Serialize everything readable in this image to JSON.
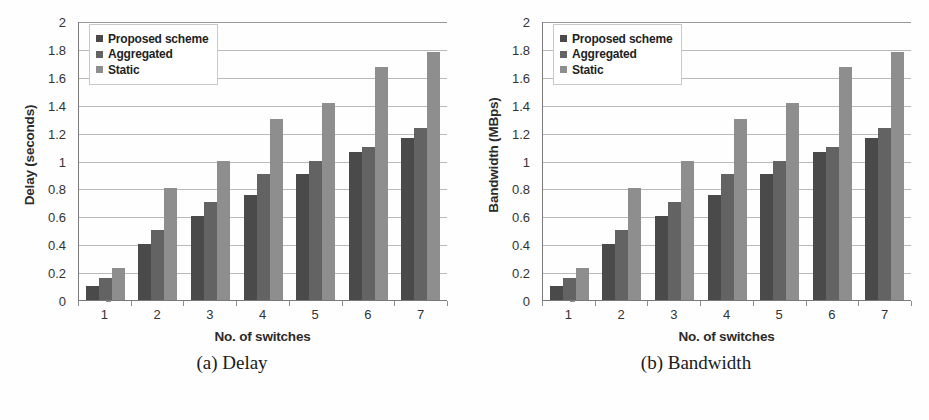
{
  "figure": {
    "subfigures": [
      {
        "caption": "(a) Delay",
        "ylabel": "Delay (seconds)",
        "xlabel": "No. of switches"
      },
      {
        "caption": "(b) Bandwidth",
        "ylabel": "Bandwidth (MBps)",
        "xlabel": "No. of switches"
      }
    ],
    "legend": {
      "items": [
        {
          "label": "Proposed scheme",
          "color": "#4a4a4a"
        },
        {
          "label": "Aggregated",
          "color": "#636363"
        },
        {
          "label": "Static",
          "color": "#8e8e8e"
        }
      ]
    },
    "yticks": [
      "2",
      "1.8",
      "1.6",
      "1.4",
      "1.2",
      "1",
      "0.8",
      "0.6",
      "0.4",
      "0.2",
      "0"
    ],
    "xticks": [
      "1",
      "2",
      "3",
      "4",
      "5",
      "6",
      "7"
    ]
  },
  "chart_data": [
    {
      "type": "bar",
      "title": "(a) Delay",
      "xlabel": "No. of switches",
      "ylabel": "Delay (seconds)",
      "categories": [
        "1",
        "2",
        "3",
        "4",
        "5",
        "6",
        "7"
      ],
      "ylim": [
        0,
        2
      ],
      "ytick_step": 0.2,
      "grid": true,
      "legend_position": "top-left",
      "series": [
        {
          "name": "Proposed scheme",
          "color": "#4a4a4a",
          "values": [
            0.1,
            0.4,
            0.6,
            0.75,
            0.9,
            1.06,
            1.16
          ]
        },
        {
          "name": "Aggregated",
          "color": "#636363",
          "values": [
            0.16,
            0.5,
            0.7,
            0.9,
            1.0,
            1.1,
            1.23
          ]
        },
        {
          "name": "Static",
          "color": "#8e8e8e",
          "values": [
            0.23,
            0.8,
            1.0,
            1.3,
            1.41,
            1.67,
            1.78
          ]
        }
      ]
    },
    {
      "type": "bar",
      "title": "(b) Bandwidth",
      "xlabel": "No. of switches",
      "ylabel": "Bandwidth (MBps)",
      "categories": [
        "1",
        "2",
        "3",
        "4",
        "5",
        "6",
        "7"
      ],
      "ylim": [
        0,
        2
      ],
      "ytick_step": 0.2,
      "grid": true,
      "legend_position": "top-left",
      "series": [
        {
          "name": "Proposed scheme",
          "color": "#4a4a4a",
          "values": [
            0.1,
            0.4,
            0.6,
            0.75,
            0.9,
            1.06,
            1.16
          ]
        },
        {
          "name": "Aggregated",
          "color": "#636363",
          "values": [
            0.16,
            0.5,
            0.7,
            0.9,
            1.0,
            1.1,
            1.23
          ]
        },
        {
          "name": "Static",
          "color": "#8e8e8e",
          "values": [
            0.23,
            0.8,
            1.0,
            1.3,
            1.41,
            1.67,
            1.78
          ]
        }
      ]
    }
  ]
}
